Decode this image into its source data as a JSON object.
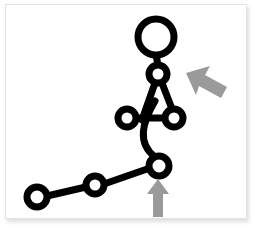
{
  "canvas": {
    "width": 257,
    "height": 231,
    "background_color": "#ffffff",
    "card": {
      "x": 5,
      "y": 4,
      "width": 242,
      "height": 215,
      "fill": "#ffffff",
      "border_color": "#e3e3e3",
      "shadow_color": "rgba(0,0,0,0.13)"
    }
  },
  "style": {
    "stroke_color": "#000000",
    "joint_fill": "#ffffff",
    "bone_width": 7,
    "joint_stroke_width": 7,
    "arrow_color": "#9a9a9a"
  },
  "figure": {
    "joints": [
      {
        "name": "head",
        "label": "head",
        "cx": 150,
        "cy": 32,
        "r": 18,
        "stroke_width": 7
      },
      {
        "name": "neck",
        "label": "neck",
        "cx": 152,
        "cy": 69,
        "r": 9,
        "stroke_width": 7
      },
      {
        "name": "left-hand",
        "label": "left hand",
        "cx": 121,
        "cy": 113,
        "r": 9,
        "stroke_width": 7
      },
      {
        "name": "right-hand",
        "label": "right hand",
        "cx": 168,
        "cy": 113,
        "r": 9,
        "stroke_width": 7
      },
      {
        "name": "hip",
        "label": "hip",
        "cx": 153,
        "cy": 161,
        "r": 10,
        "stroke_width": 7
      },
      {
        "name": "knee",
        "label": "knee",
        "cx": 89,
        "cy": 180,
        "r": 9,
        "stroke_width": 7
      },
      {
        "name": "foot",
        "label": "foot",
        "cx": 31,
        "cy": 192,
        "r": 10,
        "stroke_width": 7
      }
    ],
    "bones": [
      {
        "name": "head-to-neck",
        "from": "head",
        "to": "neck",
        "d": "M 150 50 L 152 60"
      },
      {
        "name": "neck-to-left-torso",
        "from": "neck",
        "to": "torso-left",
        "d": "M 149 78 L 136 115"
      },
      {
        "name": "neck-to-right-hand",
        "from": "neck",
        "to": "right-hand",
        "d": "M 156 78 L 166 104"
      },
      {
        "name": "arm-bar",
        "from": "left-hand",
        "to": "right-hand",
        "d": "M 130 113 L 159 113"
      },
      {
        "name": "spine-curve",
        "from": "torso",
        "to": "hip",
        "d": "M 149 96 C 136 118 131 138 149 152"
      },
      {
        "name": "hip-to-knee",
        "from": "hip",
        "to": "knee",
        "d": "M 144 163 L 98 179"
      },
      {
        "name": "knee-to-foot",
        "from": "knee",
        "to": "foot",
        "d": "M 80 182 L 41 191"
      }
    ],
    "arrows": [
      {
        "name": "upper-body-arrow",
        "label": "upper body pointer",
        "direction": "up-left",
        "color": "#9a9a9a",
        "points": "180,68 204,61 199,70 221,82 215,93 193,81 190,90"
      },
      {
        "name": "hip-arrow",
        "label": "hip pointer",
        "direction": "up",
        "color": "#9a9a9a",
        "points": "152,174 163,189 157,189 157,212 147,212 147,189 141,189"
      }
    ]
  }
}
